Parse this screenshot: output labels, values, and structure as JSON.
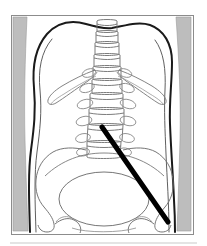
{
  "figure": {
    "kind": "anatomical-line-drawing",
    "view": "anterior-posterior",
    "region": "lumbar-spine-and-pelvis",
    "caption": "",
    "background_color": "#ffffff",
    "frame": {
      "x": 11,
      "y": 15,
      "width": 182,
      "height": 219,
      "border_color": "#8c8c8c",
      "fill_color": "#ffffff"
    },
    "shading_bands": {
      "color": "#bdbdbd",
      "edge_color": "#9a9a9a",
      "left_label": "left-soft-tissue-shadow",
      "right_label": "right-soft-tissue-shadow"
    },
    "baseline_rule": {
      "y": 243,
      "color": "#c9c9c9",
      "label": "bottom-rule"
    },
    "line_colors": {
      "body_contour": "#1a1a1a",
      "inner_contour": "#4d4d4d",
      "bone_outline": "#6b6b6b",
      "pelvis_outline": "#555555",
      "pointer": "#000000"
    },
    "pointer": {
      "label": "needle-trajectory-arrow",
      "start_x": 102,
      "start_y": 127,
      "end_x": 168,
      "end_y": 222,
      "stroke_width": 5,
      "color": "#000000"
    },
    "structures": [
      {
        "id": "body-contour",
        "name": "torso-outline",
        "count": 1
      },
      {
        "id": "vertebral-column",
        "name": "lumbar-vertebrae",
        "count": 10
      },
      {
        "id": "transverse-processes",
        "name": "transverse-processes",
        "count": 12
      },
      {
        "id": "ribs",
        "name": "twelfth-ribs",
        "count": 2
      },
      {
        "id": "ilium-left",
        "name": "left-iliac-wing",
        "count": 1
      },
      {
        "id": "ilium-right",
        "name": "right-iliac-wing",
        "count": 1
      },
      {
        "id": "sacrum",
        "name": "sacrum-pelvic-inlet",
        "count": 1
      },
      {
        "id": "femoral-heads",
        "name": "femoral-heads",
        "count": 2
      }
    ]
  },
  "chart_data": {
    "type": "scatter",
    "title": "",
    "xlabel": "",
    "ylabel": "",
    "annotations": [
      {
        "text": "",
        "type": "arrow",
        "from": [
          102,
          127
        ],
        "to": [
          168,
          222
        ]
      }
    ],
    "series": [
      {
        "name": "vertebral-body-centers",
        "x": [
          107,
          107,
          107,
          107,
          107,
          106,
          105,
          104,
          103,
          102
        ],
        "y": [
          26,
          37,
          48,
          59,
          70,
          82,
          95,
          110,
          127,
          144
        ]
      }
    ],
    "grid": false,
    "legend": "none"
  }
}
